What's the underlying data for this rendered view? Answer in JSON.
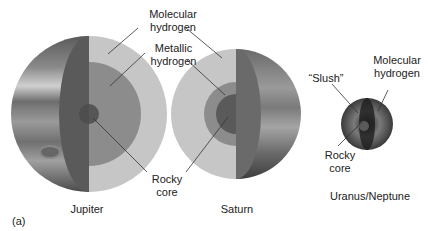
{
  "panel_label": "(a)",
  "planets": [
    {
      "name": "Jupiter"
    },
    {
      "name": "Saturn"
    },
    {
      "name": "Uranus/Neptune"
    }
  ],
  "labels": {
    "jupiter_saturn": {
      "molecular": [
        "Molecular",
        "hydrogen"
      ],
      "metallic": [
        "Metallic",
        "hydrogen"
      ],
      "rocky": [
        "Rocky",
        "core"
      ]
    },
    "uranus_neptune": {
      "slush": "“Slush”",
      "molecular": [
        "Molecular",
        "hydrogen"
      ],
      "rocky": [
        "Rocky",
        "core"
      ]
    }
  },
  "colors": {
    "molecular": "#c9c9c9",
    "metallic": "#8f8f8f",
    "core": "#555555",
    "surface_dark": "#3a3a3a",
    "surface_light": "#b0b0b0"
  }
}
